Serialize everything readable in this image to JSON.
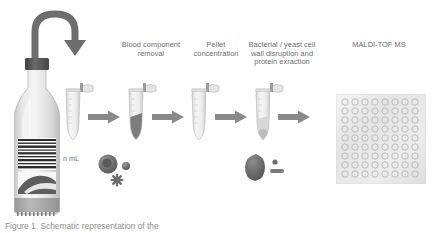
{
  "figure": {
    "caption": "Figure 1. Schematic representation of the"
  },
  "steps": [
    {
      "id": "blood-component-removal",
      "label": "Blood component\nremoval"
    },
    {
      "id": "pellet-concentration",
      "label": "Pellet concentration"
    },
    {
      "id": "cell-wall-disruption",
      "label": "Bacterial / yeast cell\nwall disruption and\nprotein exraction"
    },
    {
      "id": "maldi-tof-ms",
      "label": "MALDI-TOF MS"
    }
  ],
  "annotations": {
    "volume": "n mL"
  },
  "objects": {
    "bottle": {
      "name": "blood-culture-bottle",
      "cap_color": "#555555",
      "body_color": "#d8d8d8",
      "barcode_lines": 13
    },
    "tubes": [
      {
        "name": "eppendorf-tube-1",
        "content": "none"
      },
      {
        "name": "eppendorf-tube-2",
        "content": "dark-pellet"
      },
      {
        "name": "eppendorf-tube-3",
        "content": "none"
      },
      {
        "name": "eppendorf-tube-4",
        "content": "light-pellet"
      }
    ],
    "arrows": [
      {
        "name": "arrow-step-1"
      },
      {
        "name": "arrow-step-2"
      },
      {
        "name": "arrow-step-3"
      },
      {
        "name": "arrow-step-4"
      }
    ],
    "curved_arrow": {
      "name": "transfer-arrow",
      "color": "#6d6d6d"
    },
    "cell_groups": [
      {
        "name": "blood-cells-group",
        "shapes": [
          "large-circle",
          "small-circle",
          "star-cell"
        ]
      },
      {
        "name": "pellet-protein-group",
        "shapes": [
          "pellet-blob",
          "small-dot",
          "dash"
        ]
      }
    ],
    "maldi_plate": {
      "name": "maldi-target-plate",
      "columns": 8,
      "rows": 10,
      "spot_color": "#e9e9e9"
    }
  },
  "colors": {
    "text": "#6b6b6b",
    "arrow": "#8a8a8a",
    "tube_outline": "#c6c6c6",
    "pellet_dark": "#6f6f6f",
    "plate_bg": "#f0f0f0"
  }
}
